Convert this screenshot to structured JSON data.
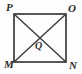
{
  "figure": {
    "type": "geometry-diagram",
    "canvas": {
      "width": 82,
      "height": 74
    },
    "background_color": "#fdfdfd",
    "stroke_color": "#2f2f2f",
    "label_color": "#2b2b2b",
    "square": {
      "top_left": {
        "x": 14,
        "y": 14
      },
      "top_right": {
        "x": 66,
        "y": 14
      },
      "bottom_right": {
        "x": 66,
        "y": 62
      },
      "bottom_left": {
        "x": 14,
        "y": 62
      },
      "stroke_width": 1.6
    },
    "diagonals": [
      {
        "name": "diagonal-P-N",
        "from": {
          "x": 14,
          "y": 14
        },
        "to": {
          "x": 66,
          "y": 62
        }
      },
      {
        "name": "diagonal-O-M",
        "from": {
          "x": 66,
          "y": 14
        },
        "to": {
          "x": 14,
          "y": 62
        }
      }
    ],
    "intersection_point": {
      "x": 40,
      "y": 38
    },
    "labels": {
      "top_left": "P",
      "top_right": "O",
      "bottom_left": "M",
      "bottom_right": "N",
      "center": "Q"
    }
  }
}
